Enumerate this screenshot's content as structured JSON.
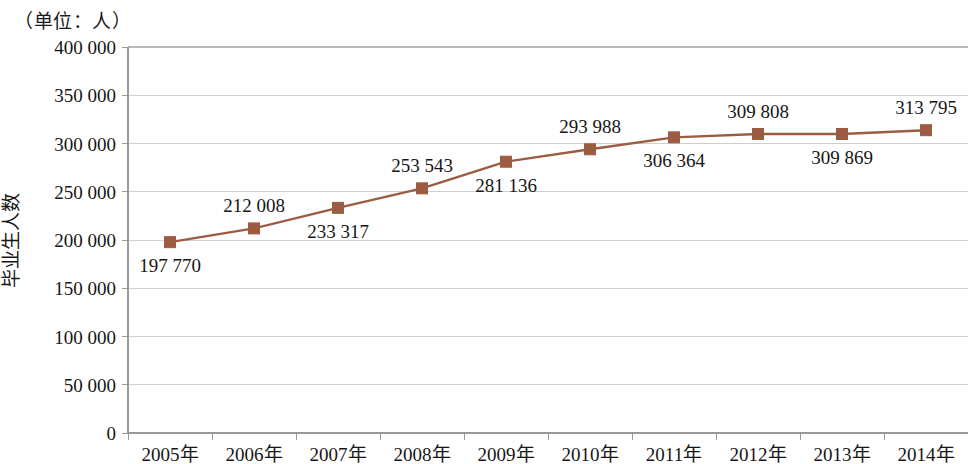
{
  "unit_note": "（单位：人）",
  "chart_data": {
    "type": "line",
    "title": "",
    "xlabel": "",
    "ylabel": "毕业生人数",
    "unit_note": "（单位：人）",
    "categories": [
      "2005年",
      "2006年",
      "2007年",
      "2008年",
      "2009年",
      "2010年",
      "2011年",
      "2012年",
      "2013年",
      "2014年"
    ],
    "values": [
      197770,
      212008,
      233317,
      253543,
      281136,
      293988,
      306364,
      309808,
      309869,
      313795
    ],
    "point_labels": [
      "197 770",
      "212 008",
      "233 317",
      "253 543",
      "281 136",
      "293 988",
      "306 364",
      "309 808",
      "309 869",
      "313 795"
    ],
    "label_positions": [
      "below",
      "above",
      "below",
      "above",
      "below",
      "above",
      "below",
      "above",
      "below",
      "above"
    ],
    "ylim": [
      0,
      400000
    ],
    "ytick_values": [
      0,
      50000,
      100000,
      150000,
      200000,
      250000,
      300000,
      350000,
      400000
    ],
    "ytick_labels": [
      "0",
      "50 000",
      "100 000",
      "150 000",
      "200 000",
      "250 000",
      "300 000",
      "350 000",
      "400 000"
    ],
    "grid": true,
    "legend": false,
    "series_color": "#9c5c42",
    "marker_color": "#9c5c42",
    "marker_shape": "square",
    "gridline_color": "#cfcfcf"
  }
}
